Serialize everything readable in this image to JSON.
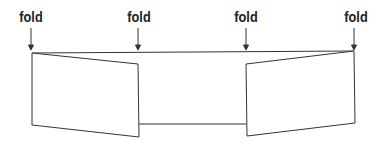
{
  "diagram": {
    "labels": [
      {
        "text": "fold",
        "x": 31
      },
      {
        "text": "fold",
        "x": 139
      },
      {
        "text": "fold",
        "x": 246
      },
      {
        "text": "fold",
        "x": 356
      }
    ],
    "colors": {
      "line": "#333333",
      "text": "#222222",
      "background": "#ffffff"
    }
  }
}
